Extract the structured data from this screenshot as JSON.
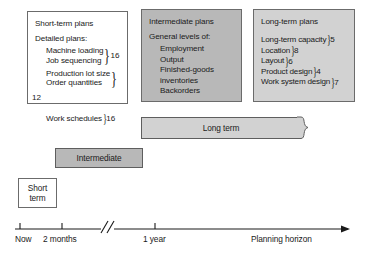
{
  "diagram": {
    "boxes": {
      "short": {
        "title": "Short-term plans",
        "subtitle": "Detailed plans:",
        "groups": [
          {
            "lines": [
              "Machine loading",
              "Job sequencing"
            ],
            "number": "16"
          },
          {
            "lines": [
              "Production lot size",
              "Order quantities"
            ],
            "number": "12"
          },
          {
            "lines": [
              "Work schedules"
            ],
            "number": "16"
          }
        ]
      },
      "intermediate": {
        "title": "Intermediate plans",
        "subtitle": "General levels of:",
        "items": [
          "Employment",
          "Output",
          "Finished-goods",
          "inventories",
          "Backorders"
        ]
      },
      "long": {
        "title": "Long-term plans",
        "items": [
          {
            "label": "Long-term capacity",
            "number": "5"
          },
          {
            "label": "Location",
            "number": "8"
          },
          {
            "label": "Layout",
            "number": "6"
          },
          {
            "label": "Product design",
            "number": "4"
          },
          {
            "label": "Work system design",
            "number": "7"
          }
        ]
      }
    },
    "bars": {
      "long": "Long term",
      "intermediate": "Intermediate",
      "short_line1": "Short",
      "short_line2": "term"
    },
    "axis": {
      "ticks": [
        "Now",
        "2 months",
        "1 year"
      ],
      "break_symbol": "//",
      "end_label": "Planning horizon"
    },
    "colors": {
      "box_white": "#ffffff",
      "box_dark_gray": "#b8b8b8",
      "box_light_gray": "#d2d2d2",
      "line": "#5e5e5e",
      "text": "#1a1a1a"
    }
  }
}
